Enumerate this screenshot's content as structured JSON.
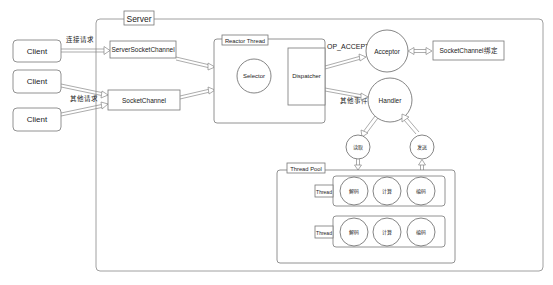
{
  "diagram": {
    "server": {
      "label": "Server"
    },
    "clients": [
      {
        "label": "Client"
      },
      {
        "label": "Client"
      },
      {
        "label": "Client"
      }
    ],
    "edge_labels": {
      "connect_request": "连接请求",
      "other_request": "其他请求",
      "op_accept": "OP_ACCEPT",
      "other_event": "其他事件"
    },
    "channels": {
      "server_socket_channel": "ServerSocketChannel",
      "socket_channel": "SocketChannel"
    },
    "reactor": {
      "label": "Reactor Thread",
      "selector": "Selector",
      "dispatcher": "Dispatcher"
    },
    "acceptor": {
      "label": "Acceptor"
    },
    "binding": {
      "label": "SocketChannel绑定"
    },
    "handler": {
      "label": "Handler"
    },
    "io": {
      "read": "读取",
      "send": "发送"
    },
    "thread_pool": {
      "label": "Thread Pool",
      "threads": [
        {
          "label": "Thread",
          "tasks": [
            "解码",
            "计算",
            "编码"
          ]
        },
        {
          "label": "Thread",
          "tasks": [
            "解码",
            "计算",
            "编码"
          ]
        }
      ]
    }
  }
}
